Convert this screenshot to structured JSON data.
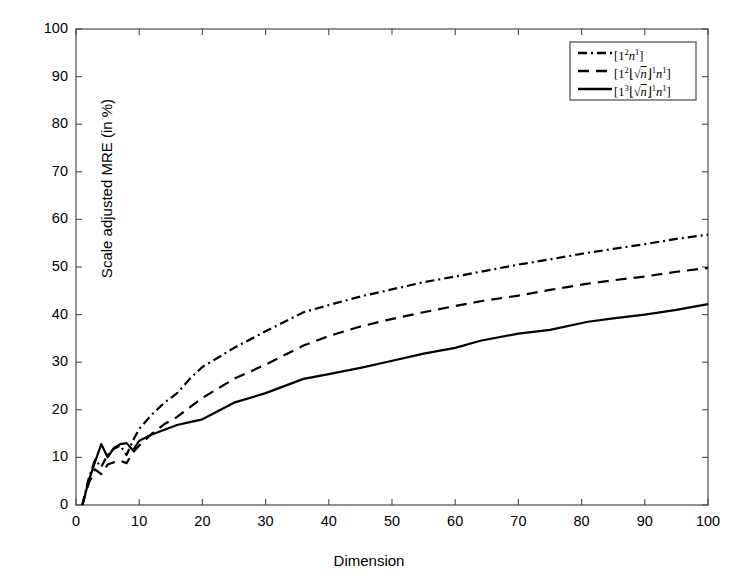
{
  "chart_data": {
    "type": "line",
    "title": "",
    "xlabel": "Dimension",
    "ylabel": "Scale adjusted MRE (in %)",
    "xlim": [
      0,
      100
    ],
    "ylim": [
      0,
      100
    ],
    "xticks": [
      0,
      10,
      20,
      30,
      40,
      50,
      60,
      70,
      80,
      90,
      100
    ],
    "yticks": [
      0,
      10,
      20,
      30,
      40,
      50,
      60,
      70,
      80,
      90,
      100
    ],
    "grid": false,
    "legend_position": "top-right",
    "series": [
      {
        "name": "[1²n¹]",
        "style": "dash-dot",
        "color": "#000000",
        "x": [
          1,
          2,
          3,
          4,
          5,
          6,
          7,
          8,
          9,
          10,
          12,
          14,
          16,
          18,
          20,
          25,
          30,
          36,
          40,
          45,
          49,
          55,
          60,
          64,
          70,
          75,
          81,
          85,
          90,
          95,
          100
        ],
        "y": [
          0,
          5.5,
          9.5,
          8.0,
          10.5,
          11.8,
          12.5,
          10.5,
          13.5,
          16.0,
          19.0,
          21.5,
          23.5,
          26.5,
          29.0,
          33.0,
          36.5,
          40.5,
          42.0,
          43.8,
          45.0,
          46.8,
          48.0,
          49.0,
          50.5,
          51.6,
          53.0,
          53.8,
          54.8,
          55.9,
          56.8
        ]
      },
      {
        "name": "[1²⌊n⌋¹n¹]",
        "style": "dashed",
        "color": "#000000",
        "x": [
          1,
          2,
          3,
          4,
          5,
          6,
          7,
          8,
          9,
          10,
          12,
          14,
          16,
          18,
          20,
          25,
          30,
          36,
          40,
          45,
          49,
          55,
          60,
          64,
          70,
          75,
          81,
          85,
          90,
          95,
          100
        ],
        "y": [
          0,
          4.5,
          7.5,
          6.5,
          8.5,
          9.0,
          9.3,
          8.8,
          11.0,
          12.5,
          15.0,
          17.0,
          18.5,
          20.5,
          22.5,
          26.5,
          29.5,
          33.5,
          35.5,
          37.5,
          38.8,
          40.5,
          41.8,
          42.8,
          44.0,
          45.2,
          46.5,
          47.2,
          48.0,
          49.0,
          49.8
        ]
      },
      {
        "name": "[1³⌊n⌋¹n¹]",
        "style": "solid",
        "color": "#000000",
        "x": [
          1,
          2,
          3,
          4,
          5,
          6,
          7,
          8,
          9,
          10,
          12,
          14,
          16,
          18,
          20,
          25,
          30,
          36,
          40,
          45,
          49,
          55,
          60,
          64,
          70,
          75,
          81,
          85,
          90,
          95,
          100
        ],
        "y": [
          0,
          5.0,
          9.0,
          12.8,
          10.0,
          12.0,
          12.8,
          13.0,
          11.5,
          13.5,
          14.8,
          15.8,
          16.8,
          17.4,
          18.0,
          21.5,
          23.5,
          26.5,
          27.5,
          28.8,
          30.0,
          31.8,
          33.0,
          34.5,
          36.0,
          36.8,
          38.5,
          39.2,
          40.0,
          41.0,
          42.2
        ]
      }
    ]
  },
  "legend": {
    "items": [
      {
        "id": "legend-item-0",
        "style": "dash-dot"
      },
      {
        "id": "legend-item-1",
        "style": "dashed"
      },
      {
        "id": "legend-item-2",
        "style": "solid"
      }
    ]
  }
}
